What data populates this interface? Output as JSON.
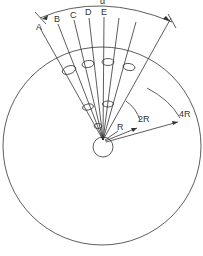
{
  "diagram": {
    "type": "radial-geometry",
    "top_label": "α",
    "ray_labels": [
      "A",
      "B",
      "C",
      "D",
      "E"
    ],
    "radius_labels": {
      "r1": "R",
      "r2": "2R",
      "r3": "4R"
    },
    "colors": {
      "stroke": "#333333",
      "background": "#ffffff"
    },
    "shapes": {
      "inner_circle_radius_label": "R",
      "outer_circle_radius_label": "4R",
      "ellipse_count": 7
    }
  }
}
